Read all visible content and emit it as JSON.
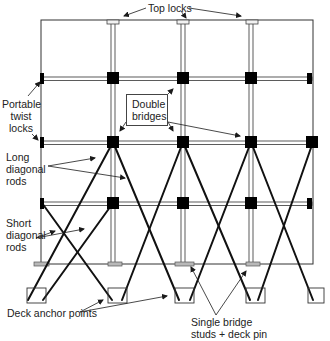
{
  "labels": {
    "top_locks": "Top locks",
    "portable_twist_locks": [
      "Portable",
      "twist",
      "locks"
    ],
    "double_bridges": [
      "Double",
      "bridges"
    ],
    "long_diagonal_rods": [
      "Long",
      "diagonal",
      "rods"
    ],
    "short_diagonal_rods": [
      "Short",
      "diagonal",
      "rods"
    ],
    "deck_anchor_points": "Deck anchor points",
    "single_bridge_studs": [
      "Single bridge",
      "studs + deck pin"
    ]
  },
  "colors": {
    "line": "#1a1a1a",
    "rod_fill": "#ffffff",
    "stud_fill": "#b8b8b8",
    "block": "#000000"
  },
  "structure": {
    "frame": {
      "x1": 41,
      "y1": 20,
      "x2": 313,
      "y2": 264
    },
    "columns_x": [
      113,
      183,
      251
    ],
    "bridge_rows_y": [
      78,
      142,
      203
    ],
    "anchor_boxes": [
      {
        "x": 27,
        "y": 288,
        "w": 19,
        "h": 15
      },
      {
        "x": 108,
        "y": 288,
        "w": 19,
        "h": 15
      },
      {
        "x": 175,
        "y": 288,
        "w": 19,
        "h": 15
      },
      {
        "x": 246,
        "y": 288,
        "w": 19,
        "h": 15
      },
      {
        "x": 308,
        "y": 288,
        "w": 16,
        "h": 15
      }
    ]
  }
}
